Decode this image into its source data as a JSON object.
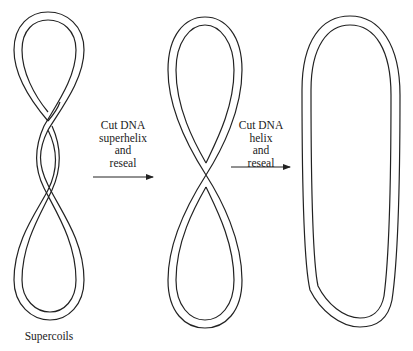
{
  "diagram": {
    "stages": [
      {
        "id": "supercoiled",
        "shape": "figure-eight with two crossings (supercoils)",
        "label": "Supercoils"
      },
      {
        "id": "figure-eight",
        "shape": "figure-eight with one crossing"
      },
      {
        "id": "relaxed",
        "shape": "relaxed closed circle (oval)"
      }
    ],
    "steps": [
      {
        "lines": [
          "Cut DNA",
          "superhelix",
          "and",
          "reseal"
        ]
      },
      {
        "lines": [
          "Cut DNA",
          "helix",
          "and",
          "reseal"
        ]
      }
    ],
    "colors": {
      "stroke": "#222222",
      "background": "#ffffff"
    }
  }
}
